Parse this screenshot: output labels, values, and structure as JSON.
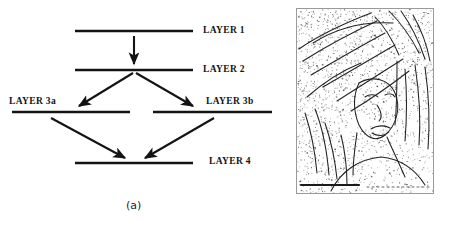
{
  "figure": {
    "panels": [
      {
        "id": "a",
        "caption": "(a)",
        "type": "layer-diagram",
        "description": "Block diagram of processing layers connected by arrows"
      },
      {
        "id": "b",
        "caption": "(b)",
        "type": "edge-image",
        "description": "Sparse dotted edge map of a portrait (Lena-style) on white background"
      }
    ]
  },
  "diagram": {
    "labels": {
      "layer1": "LAYER 1",
      "layer2": "LAYER 2",
      "layer3a": "LAYER 3a",
      "layer3b": "LAYER 3b",
      "layer4": "LAYER 4"
    },
    "line_color": "#141414",
    "arrow_color": "#141414",
    "bars": [
      {
        "name": "layer1-bar",
        "x1": 75,
        "y1": 31,
        "x2": 193,
        "y2": 31
      },
      {
        "name": "layer2-bar",
        "x1": 75,
        "y1": 70,
        "x2": 193,
        "y2": 70
      },
      {
        "name": "layer3a-bar",
        "x1": 12,
        "y1": 112,
        "x2": 130,
        "y2": 112
      },
      {
        "name": "layer3b-bar",
        "x1": 153,
        "y1": 112,
        "x2": 272,
        "y2": 112
      },
      {
        "name": "layer4-bar",
        "x1": 75,
        "y1": 163,
        "x2": 193,
        "y2": 163
      }
    ],
    "arrows": [
      {
        "name": "arrow-layer1-to-layer2",
        "x1": 134,
        "y1": 36,
        "x2": 134,
        "y2": 66
      },
      {
        "name": "arrow-layer2-to-layer3a",
        "x1": 132,
        "y1": 74,
        "x2": 76,
        "y2": 108
      },
      {
        "name": "arrow-layer2-to-layer3b",
        "x1": 136,
        "y1": 74,
        "x2": 196,
        "y2": 108
      },
      {
        "name": "arrow-layer3a-to-layer4",
        "x1": 50,
        "y1": 117,
        "x2": 128,
        "y2": 159
      },
      {
        "name": "arrow-layer3b-to-layer4",
        "x1": 215,
        "y1": 117,
        "x2": 142,
        "y2": 159
      }
    ]
  },
  "edge_image": {
    "frame_border_color": "#9a9a9a",
    "background": "#ffffff",
    "ink_color": "#2a2a2a",
    "noise_density": "sparse-speckle"
  }
}
